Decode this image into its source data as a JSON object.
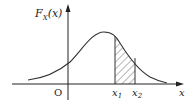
{
  "figure": {
    "y_axis_label": "F",
    "y_axis_label_sub": "X",
    "y_axis_label_arg": "(x)",
    "x_axis_label": "x",
    "origin_label": "O",
    "x1_label": "x",
    "x1_sub": "1",
    "x2_label": "x",
    "x2_sub": "2",
    "curve": "bell-shaped density curve",
    "shaded_region": "hatched area between x1 and x2 under the curve",
    "colors": {
      "stroke": "#333333",
      "background": "#ffffff"
    }
  }
}
